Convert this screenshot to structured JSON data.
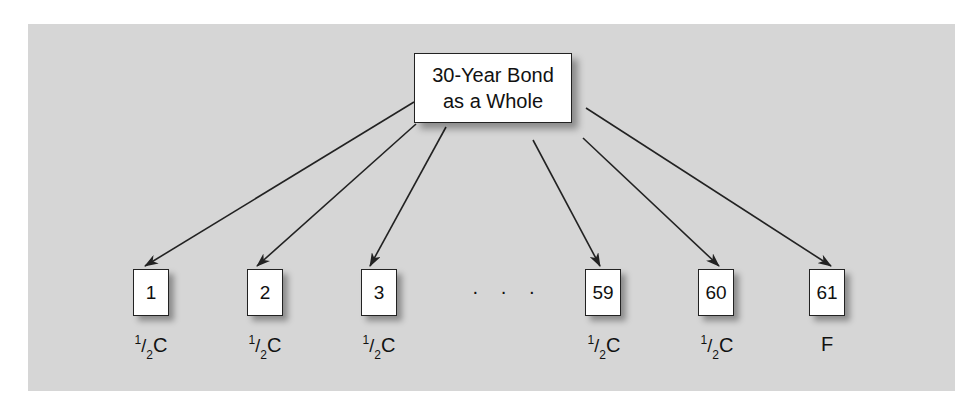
{
  "root": {
    "line1": "30-Year Bond",
    "line2": "as a Whole"
  },
  "ellipsis": "· · ·",
  "leaves": [
    {
      "label": "1",
      "cf_num": "1",
      "cf_den": "2",
      "cf_sym": "C",
      "cf_text": ""
    },
    {
      "label": "2",
      "cf_num": "1",
      "cf_den": "2",
      "cf_sym": "C",
      "cf_text": ""
    },
    {
      "label": "3",
      "cf_num": "1",
      "cf_den": "2",
      "cf_sym": "C",
      "cf_text": ""
    },
    {
      "label": "59",
      "cf_num": "1",
      "cf_den": "2",
      "cf_sym": "C",
      "cf_text": ""
    },
    {
      "label": "60",
      "cf_num": "1",
      "cf_den": "2",
      "cf_sym": "C",
      "cf_text": ""
    },
    {
      "label": "61",
      "cf_text": "F"
    }
  ],
  "colors": {
    "panel": "#d6d6d6",
    "box": "#ffffff",
    "line": "#222222"
  }
}
